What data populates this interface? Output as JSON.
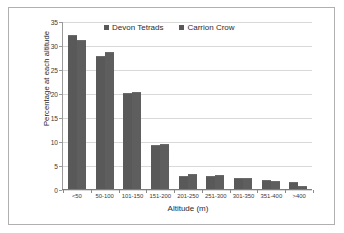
{
  "chart_data": {
    "type": "bar",
    "title": "",
    "subtitle": "",
    "xlabel": "Altitude (m)",
    "ylabel": "Percentage at each altitude",
    "categories": [
      "<50",
      "50-100",
      "101-150",
      "151-200",
      "201-250",
      "251-300",
      "301-350",
      "351-400",
      ">400"
    ],
    "series": [
      {
        "name": "Devon Tetrads",
        "color": "#595959",
        "values": [
          32.0,
          27.7,
          20.0,
          9.1,
          2.8,
          2.8,
          2.2,
          1.8,
          1.5
        ]
      },
      {
        "name": "Carrion Crow",
        "color": "#5e5e5e",
        "values": [
          31.0,
          28.5,
          20.2,
          9.4,
          3.1,
          2.9,
          2.2,
          1.7,
          0.7
        ]
      }
    ],
    "ylim": [
      0,
      35
    ],
    "yticks": [
      0,
      5,
      10,
      15,
      20,
      25,
      30,
      35
    ],
    "ytick_labels": [
      "0",
      "5",
      "10",
      "15",
      "20",
      "25",
      "30",
      "35"
    ],
    "grid": "horizontal",
    "legend_position": "top-center"
  },
  "legend": {
    "items": [
      {
        "label": "Devon Tetrads",
        "swatch": "legend-swatch-devon-tetrads"
      },
      {
        "label": "Carrion Crow",
        "swatch": "legend-swatch-carrion-crow"
      }
    ]
  }
}
